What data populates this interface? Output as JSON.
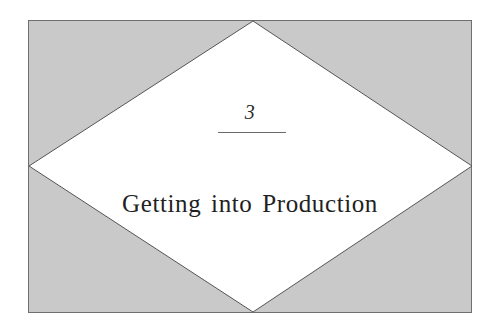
{
  "page": {
    "kind": "book-chapter-opener",
    "background_color": "#ffffff"
  },
  "panel": {
    "fill_color": "#c9c9c9",
    "border_color": "#6f6f6f"
  },
  "diamond": {
    "fill_color": "#ffffff",
    "stroke_color": "#555555"
  },
  "chapter": {
    "number": "3",
    "title": "Getting into Production"
  }
}
